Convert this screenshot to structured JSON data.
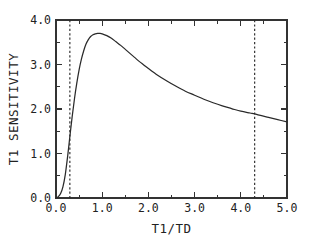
{
  "chart_data": {
    "type": "line",
    "title": "",
    "xlabel": "T1/TD",
    "ylabel": "T1 SENSITIVITY",
    "xlim": [
      0.0,
      5.0
    ],
    "ylim": [
      0.0,
      4.0
    ],
    "grid": false,
    "legend": false,
    "x_major_ticks": [
      0.0,
      1.0,
      2.0,
      3.0,
      4.0,
      5.0
    ],
    "x_tick_labels": [
      "0.0",
      "1.0",
      "2.0",
      "3.0",
      "4.0",
      "5.0"
    ],
    "x_minor_step": 0.5,
    "y_major_ticks": [
      0.0,
      1.0,
      2.0,
      3.0,
      4.0
    ],
    "y_tick_labels": [
      "0.0",
      "1.0",
      "2.0",
      "3.0",
      "4.0"
    ],
    "y_minor_step": 0.5,
    "series": [
      {
        "name": "T1 sensitivity",
        "style": "solid",
        "x": [
          0.0,
          0.05,
          0.1,
          0.15,
          0.2,
          0.25,
          0.3,
          0.35,
          0.4,
          0.45,
          0.5,
          0.55,
          0.6,
          0.65,
          0.7,
          0.75,
          0.8,
          0.85,
          0.9,
          0.95,
          1.0,
          1.1,
          1.2,
          1.3,
          1.4,
          1.5,
          1.6,
          1.7,
          1.8,
          1.9,
          2.0,
          2.2,
          2.4,
          2.6,
          2.8,
          3.0,
          3.2,
          3.4,
          3.6,
          3.8,
          4.0,
          4.2,
          4.3,
          4.4,
          4.6,
          4.8,
          5.0
        ],
        "y": [
          0.0,
          0.03,
          0.1,
          0.25,
          0.52,
          0.92,
          1.38,
          1.83,
          2.23,
          2.58,
          2.88,
          3.12,
          3.31,
          3.46,
          3.56,
          3.63,
          3.67,
          3.69,
          3.7,
          3.7,
          3.69,
          3.65,
          3.59,
          3.51,
          3.43,
          3.34,
          3.25,
          3.16,
          3.07,
          2.99,
          2.91,
          2.76,
          2.63,
          2.51,
          2.4,
          2.31,
          2.22,
          2.14,
          2.07,
          2.01,
          1.95,
          1.91,
          1.89,
          1.86,
          1.81,
          1.76,
          1.71
        ]
      }
    ],
    "annotations": [
      {
        "name": "lower-bound-marker",
        "type": "vline",
        "x": 0.3,
        "style": "dashed",
        "label": ""
      },
      {
        "name": "upper-bound-marker",
        "type": "vline",
        "x": 4.3,
        "style": "dashed",
        "label": ""
      }
    ],
    "peak": {
      "x": 0.95,
      "y": 3.7
    },
    "colors": {
      "curve": "#2a2a2a",
      "axis": "#333333",
      "marker": "#2a2a2a",
      "background": "#ffffff"
    }
  }
}
